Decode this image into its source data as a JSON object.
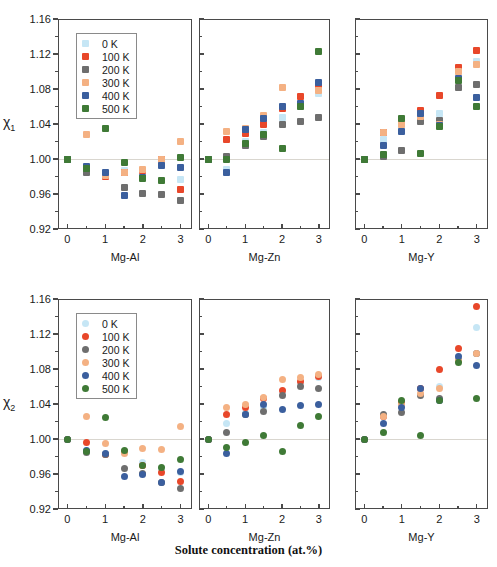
{
  "figure": {
    "supertitle": "Solute concentration (at.%)",
    "series_colors": {
      "0 K": "#c6e6f5",
      "100 K": "#e8472a",
      "200 K": "#6e6e6e",
      "300 K": "#f4b183",
      "400 K": "#3b5f9e",
      "500 K": "#3f7a36"
    },
    "legend_labels": [
      "0 K",
      "100 K",
      "200 K",
      "300 K",
      "400 K",
      "500 K"
    ],
    "y_ticks": [
      "0.92",
      "0.96",
      "1.00",
      "1.04",
      "1.08",
      "1.12",
      "1.16"
    ],
    "x_ticks": [
      "0",
      "1",
      "2",
      "3"
    ],
    "row_titles": [
      "χ₁",
      "χ₂"
    ],
    "panel_titles": [
      "Mg-Al",
      "Mg-Zn",
      "Mg-Y"
    ]
  },
  "chart_data": [
    {
      "type": "scatter",
      "id": "chi1-Mg-Al",
      "title": "",
      "xlabel": "Mg-Al",
      "ylabel": "χ₁",
      "marker": "square",
      "xlim": [
        -0.25,
        3.3
      ],
      "ylim": [
        0.92,
        1.16
      ],
      "grid": false,
      "zero_reference": 1.0,
      "legend_position": "upper-left",
      "x": [
        0,
        0.5,
        1,
        1.5,
        2,
        2.5,
        3
      ],
      "series": [
        {
          "name": "0 K",
          "values": [
            1.0,
            0.989,
            0.984,
            0.987,
            0.986,
            0.995,
            0.977
          ]
        },
        {
          "name": "100 K",
          "values": [
            1.0,
            0.987,
            0.98,
            0.985,
            0.987,
            1.0,
            0.965
          ]
        },
        {
          "name": "200 K",
          "values": [
            1.0,
            0.985,
            0.983,
            0.968,
            0.961,
            0.959,
            0.953
          ]
        },
        {
          "name": "300 K",
          "values": [
            1.0,
            1.028,
            0.981,
            0.985,
            0.988,
            1.0,
            1.02
          ]
        },
        {
          "name": "400 K",
          "values": [
            1.0,
            0.992,
            0.985,
            0.958,
            0.979,
            0.993,
            0.99
          ]
        },
        {
          "name": "500 K",
          "values": [
            1.0,
            0.989,
            1.035,
            0.996,
            0.978,
            0.975,
            1.002
          ]
        }
      ]
    },
    {
      "type": "scatter",
      "id": "chi1-Mg-Zn",
      "title": "",
      "xlabel": "Mg-Zn",
      "ylabel": "",
      "marker": "square",
      "xlim": [
        -0.25,
        3.3
      ],
      "ylim": [
        0.92,
        1.16
      ],
      "grid": false,
      "zero_reference": 1.0,
      "x": [
        0,
        0.5,
        1,
        1.5,
        2,
        2.5,
        3
      ],
      "series": [
        {
          "name": "0 K",
          "values": [
            1.0,
            0.988,
            1.02,
            1.03,
            1.048,
            1.06,
            1.075
          ]
        },
        {
          "name": "100 K",
          "values": [
            1.0,
            1.022,
            1.029,
            1.04,
            1.058,
            1.072,
            1.085
          ]
        },
        {
          "name": "200 K",
          "values": [
            1.0,
            1.003,
            1.016,
            1.026,
            1.04,
            1.043,
            1.048
          ]
        },
        {
          "name": "300 K",
          "values": [
            1.0,
            1.031,
            1.035,
            1.05,
            1.082,
            1.062,
            1.078
          ]
        },
        {
          "name": "400 K",
          "values": [
            1.0,
            0.985,
            1.034,
            1.046,
            1.06,
            1.063,
            1.088
          ]
        },
        {
          "name": "500 K",
          "values": [
            1.0,
            1.0,
            1.018,
            1.028,
            1.012,
            1.06,
            1.123
          ]
        }
      ]
    },
    {
      "type": "scatter",
      "id": "chi1-Mg-Y",
      "title": "",
      "xlabel": "Mg-Y",
      "ylabel": "",
      "marker": "square",
      "xlim": [
        -0.25,
        3.3
      ],
      "ylim": [
        0.92,
        1.16
      ],
      "grid": false,
      "zero_reference": 1.0,
      "x": [
        0,
        0.5,
        1,
        1.5,
        2,
        2.5,
        3
      ],
      "series": [
        {
          "name": "0 K",
          "values": [
            1.0,
            1.022,
            1.038,
            1.052,
            1.052,
            1.1,
            1.112
          ]
        },
        {
          "name": "100 K",
          "values": [
            1.0,
            1.03,
            1.042,
            1.056,
            1.073,
            1.105,
            1.124
          ]
        },
        {
          "name": "200 K",
          "values": [
            1.0,
            1.003,
            1.01,
            1.043,
            1.044,
            1.082,
            1.085
          ]
        },
        {
          "name": "300 K",
          "values": [
            1.0,
            1.03,
            1.04,
            1.049,
            1.04,
            1.1,
            1.108
          ]
        },
        {
          "name": "400 K",
          "values": [
            1.0,
            1.016,
            1.032,
            1.052,
            1.038,
            1.092,
            1.07
          ]
        },
        {
          "name": "500 K",
          "values": [
            1.0,
            1.005,
            1.046,
            1.006,
            1.037,
            1.09,
            1.06
          ]
        }
      ]
    },
    {
      "type": "scatter",
      "id": "chi2-Mg-Al",
      "title": "",
      "xlabel": "Mg-Al",
      "ylabel": "χ₂",
      "marker": "circle",
      "xlim": [
        -0.25,
        3.3
      ],
      "ylim": [
        0.92,
        1.16
      ],
      "grid": false,
      "zero_reference": 1.0,
      "legend_position": "upper-left",
      "x": [
        0,
        0.5,
        1,
        1.5,
        2,
        2.5,
        3
      ],
      "series": [
        {
          "name": "0 K",
          "values": [
            1.0,
            0.987,
            0.983,
            0.985,
            0.973,
            0.966,
            0.962
          ]
        },
        {
          "name": "100 K",
          "values": [
            1.0,
            0.996,
            0.982,
            0.986,
            0.97,
            0.962,
            0.952
          ]
        },
        {
          "name": "200 K",
          "values": [
            1.0,
            0.985,
            0.982,
            0.966,
            0.961,
            0.95,
            0.944
          ]
        },
        {
          "name": "300 K",
          "values": [
            1.0,
            1.026,
            0.995,
            0.984,
            0.989,
            0.988,
            1.014
          ]
        },
        {
          "name": "400 K",
          "values": [
            1.0,
            0.987,
            0.983,
            0.957,
            0.96,
            0.95,
            0.963
          ]
        },
        {
          "name": "500 K",
          "values": [
            1.0,
            0.986,
            1.025,
            0.987,
            0.97,
            0.968,
            0.977
          ]
        }
      ]
    },
    {
      "type": "scatter",
      "id": "chi2-Mg-Zn",
      "title": "",
      "xlabel": "Mg-Zn",
      "ylabel": "",
      "marker": "circle",
      "xlim": [
        -0.25,
        3.3
      ],
      "ylim": [
        0.92,
        1.16
      ],
      "grid": false,
      "zero_reference": 1.0,
      "x": [
        0,
        0.5,
        1,
        1.5,
        2,
        2.5,
        3
      ],
      "series": [
        {
          "name": "0 K",
          "values": [
            1.0,
            1.018,
            1.03,
            1.036,
            1.052,
            1.064,
            1.07
          ]
        },
        {
          "name": "100 K",
          "values": [
            1.0,
            1.028,
            1.036,
            1.046,
            1.056,
            1.066,
            1.072
          ]
        },
        {
          "name": "200 K",
          "values": [
            1.0,
            1.008,
            1.028,
            1.032,
            1.05,
            1.06,
            1.058
          ]
        },
        {
          "name": "300 K",
          "values": [
            1.0,
            1.036,
            1.04,
            1.048,
            1.068,
            1.07,
            1.074
          ]
        },
        {
          "name": "400 K",
          "values": [
            1.0,
            0.984,
            1.028,
            1.04,
            1.034,
            1.038,
            1.04
          ]
        },
        {
          "name": "500 K",
          "values": [
            1.0,
            0.99,
            0.996,
            1.004,
            0.986,
            1.016,
            1.026
          ]
        }
      ]
    },
    {
      "type": "scatter",
      "id": "chi2-Mg-Y",
      "title": "",
      "xlabel": "Mg-Y",
      "ylabel": "",
      "marker": "circle",
      "xlim": [
        -0.25,
        3.3
      ],
      "ylim": [
        0.92,
        1.16
      ],
      "grid": false,
      "zero_reference": 1.0,
      "x": [
        0,
        0.5,
        1,
        1.5,
        2,
        2.5,
        3
      ],
      "series": [
        {
          "name": "0 K",
          "values": [
            1.0,
            1.026,
            1.042,
            1.058,
            1.06,
            1.094,
            1.128
          ]
        },
        {
          "name": "100 K",
          "values": [
            1.0,
            1.026,
            1.042,
            1.058,
            1.08,
            1.104,
            1.152
          ]
        },
        {
          "name": "200 K",
          "values": [
            1.0,
            1.028,
            1.03,
            1.05,
            1.046,
            1.09,
            1.098
          ]
        },
        {
          "name": "300 K",
          "values": [
            1.0,
            1.026,
            1.04,
            1.052,
            1.058,
            1.09,
            1.098
          ]
        },
        {
          "name": "400 K",
          "values": [
            1.0,
            1.018,
            1.036,
            1.058,
            1.044,
            1.094,
            1.084
          ]
        },
        {
          "name": "500 K",
          "values": [
            1.0,
            1.008,
            1.044,
            1.004,
            1.044,
            1.088,
            1.046
          ]
        }
      ]
    }
  ]
}
